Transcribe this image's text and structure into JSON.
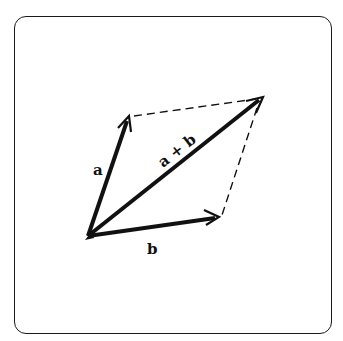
{
  "diagram": {
    "labels": {
      "a": "a",
      "b": "b",
      "sum": "a + b"
    },
    "points": {
      "origin": [
        88,
        236
      ],
      "a_tip": [
        129,
        117
      ],
      "b_tip": [
        219,
        217
      ],
      "sum_tip": [
        263,
        97
      ]
    },
    "colors": {
      "stroke": "#111111",
      "background": "#ffffff"
    }
  }
}
